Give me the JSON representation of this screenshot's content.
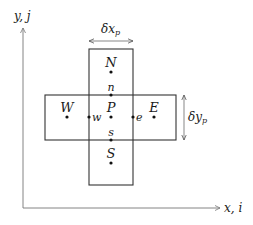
{
  "diagram": {
    "type": "finite-volume-stencil",
    "axes": {
      "y_label": "y, j",
      "x_label": "x, i"
    },
    "dimensions": {
      "dx": {
        "base": "δx",
        "sub": "p"
      },
      "dy": {
        "base": "δy",
        "sub": "p"
      }
    },
    "nodes": [
      {
        "id": "N",
        "label": "N",
        "kind": "neighbor-center"
      },
      {
        "id": "n",
        "label": "n",
        "kind": "face"
      },
      {
        "id": "W",
        "label": "W",
        "kind": "neighbor-center"
      },
      {
        "id": "w",
        "label": "w",
        "kind": "face"
      },
      {
        "id": "P",
        "label": "P",
        "kind": "cell-center"
      },
      {
        "id": "e",
        "label": "e",
        "kind": "face"
      },
      {
        "id": "E",
        "label": "E",
        "kind": "neighbor-center"
      },
      {
        "id": "s",
        "label": "s",
        "kind": "face"
      },
      {
        "id": "S",
        "label": "S",
        "kind": "neighbor-center"
      }
    ],
    "colors": {
      "line": "#333333",
      "axis": "#777777",
      "text": "#1a1a1a",
      "dot": "#111111"
    }
  }
}
